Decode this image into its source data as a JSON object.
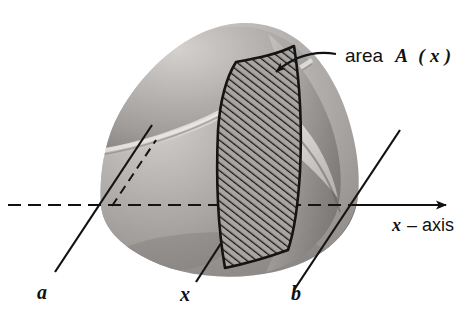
{
  "figure": {
    "background_color": "#ffffff",
    "ink_color": "#111111",
    "labels": {
      "a": "a",
      "x": "x",
      "b": "b",
      "axis_symbol": "x",
      "axis_dash": "–",
      "axis_word": "axis",
      "area_word": "area",
      "area_symbol": "A",
      "area_open_paren": "(",
      "area_arg": "x",
      "area_close_paren": ")"
    },
    "annotation": {
      "callout_text": "area A (x)",
      "callout_target": "hatched-cross-section",
      "leader_style": "curved-line-with-arrowhead"
    },
    "axis": {
      "name": "x-axis",
      "style_left_of_solid": "dashed",
      "style_inside_solid": "dashed",
      "style_right_of_solid": "solid",
      "arrowhead": "right",
      "y_position_px": 205,
      "x_start_px": 8,
      "x_end_px": 452
    },
    "cut_planes": [
      {
        "name": "a",
        "label": "a",
        "axis_crossing_x_px": 108,
        "line_angle": "lower-left-to-upper-right"
      },
      {
        "name": "x",
        "label": "x",
        "axis_crossing_x_px": 222,
        "line_angle": "lower-left-to-upper-right"
      },
      {
        "name": "b",
        "label": "b",
        "axis_crossing_x_px": 348,
        "line_angle": "lower-left-to-upper-right"
      }
    ],
    "solid": {
      "description": "shaded rounded dome-like solid",
      "shading": "grayscale gradient, light upper-left, dark lower-right",
      "tones": {
        "highlight": "#d8d5d2",
        "light": "#bdb9b6",
        "mid": "#a39f9c",
        "dark": "#8a8683",
        "darker": "#6f6b68"
      }
    },
    "cross_section": {
      "name": "A(x)",
      "fill": "diagonal-hatching",
      "hatch_direction": "lower-left-to-upper-right",
      "hatch_color": "#1a1a1a",
      "outline_color": "#111111"
    }
  }
}
